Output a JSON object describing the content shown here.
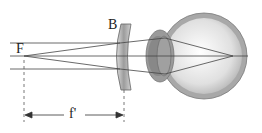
{
  "diagram": {
    "labels": {
      "focal_point": "F",
      "lens": "B",
      "focal_length": "f'"
    },
    "colors": {
      "line": "#444444",
      "lens_fill": "#c8c8c8",
      "eye_outer": "#9a9a9a",
      "eye_inner": "#eeeeee"
    }
  }
}
